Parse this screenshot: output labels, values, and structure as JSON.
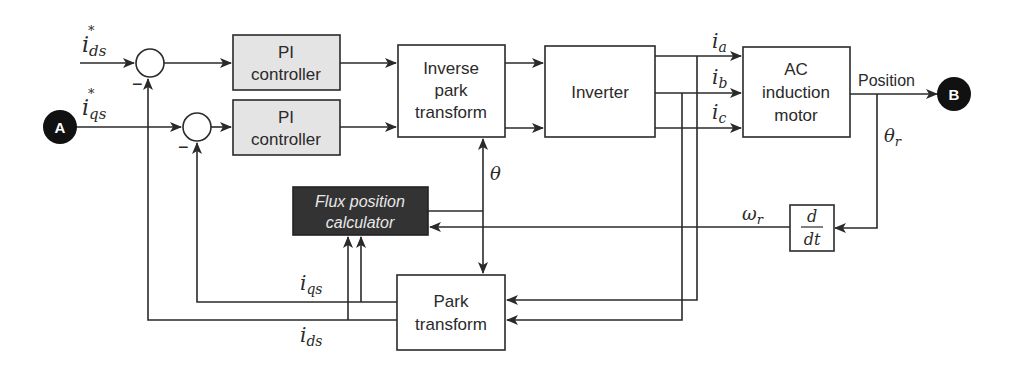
{
  "diagram": {
    "type": "block-diagram",
    "title_hint": "Field-oriented control of AC induction motor",
    "colors": {
      "line": "#2a2a2a",
      "pi_fill": "#e4e4e4",
      "flux_fill": "#333333",
      "flux_text": "#e8e8e8",
      "connector_fill": "#111111"
    },
    "inputs": {
      "ids_ref": {
        "base": "i",
        "sub": "ds",
        "sup": "*"
      },
      "iqs_ref": {
        "base": "i",
        "sub": "qs",
        "sup": "*"
      }
    },
    "connectors": {
      "a": "A",
      "b": "B"
    },
    "summers": [
      {
        "id": "sum-d",
        "sign": "−"
      },
      {
        "id": "sum-q",
        "sign": "−"
      }
    ],
    "blocks": {
      "pi_d": {
        "line1": "PI",
        "line2": "controller"
      },
      "pi_q": {
        "line1": "PI",
        "line2": "controller"
      },
      "inverse_park": {
        "line1": "Inverse",
        "line2": "park",
        "line3": "transform"
      },
      "inverter": {
        "line1": "Inverter"
      },
      "motor": {
        "line1": "AC",
        "line2": "induction",
        "line3": "motor"
      },
      "flux": {
        "line1": "Flux position",
        "line2": "calculator"
      },
      "park": {
        "line1": "Park",
        "line2": "transform"
      },
      "ddt": {
        "num": "d",
        "den": "dt"
      }
    },
    "signals": {
      "ia": {
        "base": "i",
        "sub": "a"
      },
      "ib": {
        "base": "i",
        "sub": "b"
      },
      "ic": {
        "base": "i",
        "sub": "c"
      },
      "position": "Position",
      "theta_r": {
        "base": "θ",
        "sub": "r"
      },
      "theta": "θ",
      "omega_r": {
        "base": "ω",
        "sub": "r"
      },
      "iqs": {
        "base": "i",
        "sub": "qs"
      },
      "ids": {
        "base": "i",
        "sub": "ds"
      }
    }
  }
}
